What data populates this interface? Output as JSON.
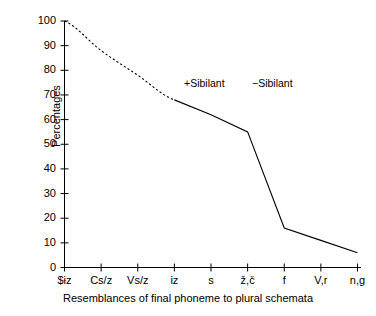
{
  "chart_data": {
    "type": "line",
    "title": "",
    "xlabel": "Resemblances of final phoneme to plural schemata",
    "ylabel": "Percentages",
    "ylim": [
      0,
      100
    ],
    "ytick_step": 10,
    "yticks": [
      0,
      10,
      20,
      30,
      40,
      50,
      60,
      70,
      80,
      90,
      100
    ],
    "grid": false,
    "legend": "none",
    "categories": [
      "$ɨz",
      "Cs/z",
      "Vs/z",
      "iz",
      "s",
      "ž,č",
      "f",
      "V,r",
      "n,g"
    ],
    "values": [
      100,
      88,
      78,
      68,
      62,
      55,
      16,
      11,
      6
    ],
    "series": [
      {
        "name": "Percentages",
        "values": [
          100,
          88,
          78,
          68,
          62,
          55,
          16,
          11,
          6
        ],
        "style_segments": [
          {
            "from_index": 0,
            "to_index": 3,
            "style": "dashed"
          },
          {
            "from_index": 3,
            "to_index": 8,
            "style": "solid"
          }
        ],
        "color": "#000000"
      }
    ],
    "annotations": [
      {
        "text": "+Sibilant",
        "x_category": "iz",
        "y": 70
      },
      {
        "text": "−Sibilant",
        "x_category": "ž,č",
        "y": 70
      }
    ]
  },
  "axes": {
    "y_labels": [
      "100",
      "90",
      "80",
      "70",
      "60",
      "50",
      "40",
      "30",
      "20",
      "10",
      "0"
    ],
    "y_title": "Percentages",
    "x_labels": [
      "$ɨz",
      "Cs/z",
      "Vs/z",
      "iz",
      "s",
      "ž,č",
      "f",
      "V,r",
      "n,g"
    ],
    "x_title": "Resemblances of final phoneme to plural schemata"
  },
  "annotations": {
    "plus_sibilant": "+Sibilant",
    "minus_sibilant": "−Sibilant"
  },
  "colors": {
    "line": "#000000",
    "axis": "#000000",
    "background": "#ffffff"
  }
}
